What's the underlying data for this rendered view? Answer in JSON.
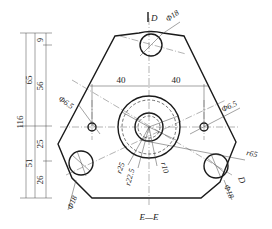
{
  "drawing": {
    "section_label": "E—E",
    "dimensions": {
      "vertical": {
        "total": "116",
        "upper": "65",
        "lower": "51",
        "top_small": "9",
        "top_mid": "56",
        "lower_upper": "25",
        "lower_bottom": "26"
      },
      "horizontal": {
        "left_spacing": "40",
        "right_spacing": "40"
      },
      "diameters": {
        "top_hole": "Φ18",
        "left_small_hole": "Φ6.5",
        "right_small_hole": "Φ6.5",
        "bottom_left_hole": "Φ18",
        "bottom_right_hole": "Φ18"
      },
      "radii": {
        "outer": "r65",
        "boss_outer": "r25",
        "boss_dashed": "r22.5",
        "bore": "r10"
      },
      "section_markers": {
        "top": "D",
        "right": "D"
      }
    }
  }
}
